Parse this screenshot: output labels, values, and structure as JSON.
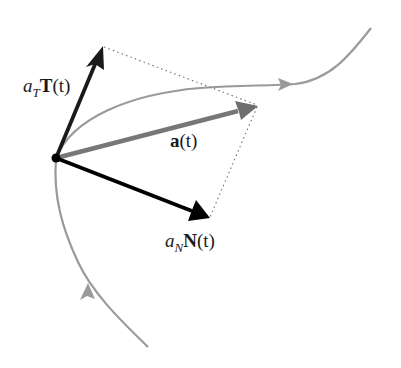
{
  "diagram": {
    "colors": {
      "background": "#ffffff",
      "curve": "#9a9a9a",
      "tangent_vector": "#1a1a1a",
      "normal_vector": "#000000",
      "acceleration_vector": "#777777",
      "dotted_guides": "#7a7a7a",
      "point": "#000000"
    },
    "point": {
      "x": 56,
      "y": 158
    },
    "vectors": [
      {
        "id": "tangential",
        "label_base": "a",
        "label_sub": "T",
        "label_vec": "T",
        "label_arg": "(t)",
        "tip": {
          "x": 102,
          "y": 46
        }
      },
      {
        "id": "acceleration",
        "label_vec": "a",
        "label_arg": "(t)",
        "tip": {
          "x": 257,
          "y": 106
        }
      },
      {
        "id": "normal",
        "label_base": "a",
        "label_sub": "N",
        "label_vec": "N",
        "label_arg": "(t)",
        "tip": {
          "x": 209,
          "y": 218
        }
      }
    ],
    "labels": {
      "tangential": {
        "a": "a",
        "sub": "T",
        "vec": "T",
        "arg": "(t)"
      },
      "acceleration": {
        "vec": "a",
        "arg": "(t)"
      },
      "normal": {
        "a": "a",
        "sub": "N",
        "vec": "N",
        "arg": "(t)"
      }
    },
    "curve": {
      "description": "Smooth space curve with direction arrows, passing through the point",
      "direction_arrows": 2
    }
  }
}
